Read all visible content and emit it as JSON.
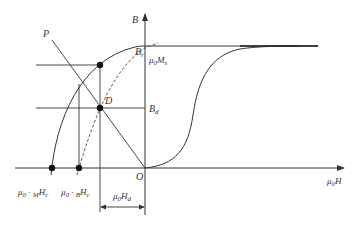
{
  "diagram": {
    "colors": {
      "line": "#333333",
      "dashed": "#444444",
      "background": "#ffffff"
    },
    "axes": {
      "y_label": {
        "main": "B"
      },
      "x_label": {
        "main": "μ",
        "sub": "0",
        "tail": "H"
      },
      "origin": "O"
    },
    "labels": {
      "load_line": "P",
      "operating_point": "D",
      "remanence": {
        "main": "B",
        "sub": "r"
      },
      "saturation_mag": {
        "main": "μ",
        "sub1": "0",
        "tail": "M",
        "sub2": "s"
      },
      "b_d": {
        "main": "B",
        "sub": "d"
      },
      "mhc": {
        "main": "μ",
        "sub1": "0",
        "mid": " · ",
        "sub2": "M",
        "tail": "H",
        "sub3": "c"
      },
      "bhc": {
        "main": "μ",
        "sub1": "0",
        "mid": " · ",
        "sub2": "B",
        "tail": "H",
        "sub3": "c"
      },
      "h_d": {
        "main": "μ",
        "sub1": "0",
        "tail": "H",
        "sub2": "d"
      }
    },
    "points": [
      {
        "name": "intrinsic-curve-point",
        "x": 100,
        "y": 65
      },
      {
        "name": "operating-point-D",
        "x": 100,
        "y": 108
      },
      {
        "name": "intrinsic-coercivity-point",
        "x": 52,
        "y": 168
      },
      {
        "name": "normal-coercivity-point",
        "x": 79,
        "y": 168
      }
    ]
  }
}
